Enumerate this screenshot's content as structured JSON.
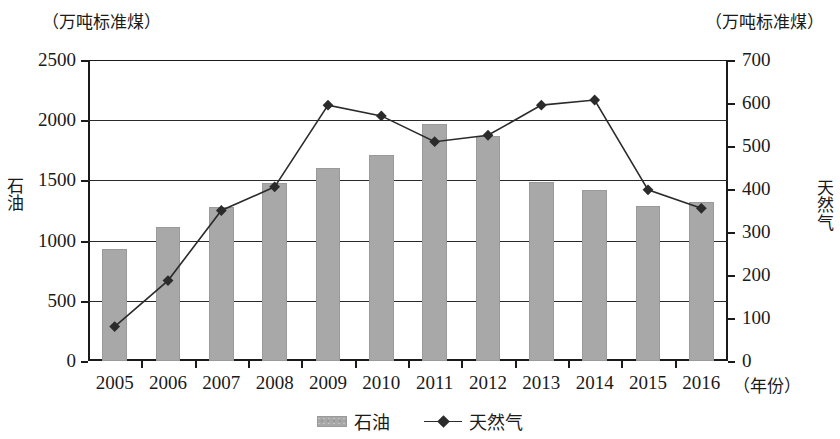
{
  "axis_units": {
    "left_unit": "（万吨标准煤）",
    "right_unit": "（万吨标准煤）"
  },
  "series_side_labels": {
    "left": "石油",
    "right": "天然气"
  },
  "xaxis_title": "（年份）",
  "legend": [
    {
      "label": "石油",
      "marker": "bar-swatch"
    },
    {
      "label": "天然气",
      "marker": "line-diamond"
    }
  ],
  "chart_data": {
    "type": "bar",
    "title": "",
    "subtitle": "",
    "xlabel": "（年份）",
    "ylabel": "石油",
    "y2label": "天然气",
    "grid": true,
    "legend_position": "bottom-center",
    "categories": [
      "2005",
      "2006",
      "2007",
      "2008",
      "2009",
      "2010",
      "2011",
      "2012",
      "2013",
      "2014",
      "2015",
      "2016"
    ],
    "ylim": [
      0,
      2500
    ],
    "y2lim": [
      0,
      700
    ],
    "yticks": [
      "0",
      "500",
      "1000",
      "1500",
      "2000",
      "2500"
    ],
    "y2ticks": [
      "0",
      "100",
      "200",
      "300",
      "400",
      "500",
      "600",
      "700"
    ],
    "series": [
      {
        "name": "石油",
        "type": "bar",
        "axis": "left",
        "unit": "万吨标准煤",
        "color": "#a8a8a8",
        "values": [
          930,
          1115,
          1275,
          1480,
          1605,
          1715,
          1965,
          1870,
          1490,
          1420,
          1285,
          1320
        ]
      },
      {
        "name": "天然气",
        "type": "line",
        "axis": "right",
        "unit": "万吨标准煤",
        "color": "#2b2b2b",
        "marker": "diamond",
        "values": [
          80,
          187,
          350,
          405,
          595,
          570,
          510,
          525,
          595,
          607,
          398,
          355
        ]
      }
    ]
  }
}
